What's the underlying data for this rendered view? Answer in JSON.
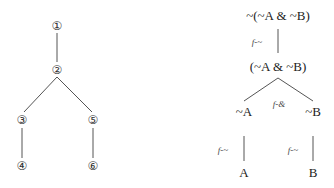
{
  "left_tree": {
    "nodes": [
      {
        "id": "n1",
        "label": "①",
        "x": 57,
        "y": 26
      },
      {
        "id": "n2",
        "label": "②",
        "x": 57,
        "y": 70
      },
      {
        "id": "n3",
        "label": "③",
        "x": 22,
        "y": 120
      },
      {
        "id": "n4",
        "label": "④",
        "x": 22,
        "y": 166
      },
      {
        "id": "n5",
        "label": "⑤",
        "x": 93,
        "y": 120
      },
      {
        "id": "n6",
        "label": "⑥",
        "x": 93,
        "y": 166
      }
    ],
    "edges": [
      [
        "n1",
        "n2"
      ],
      [
        "n2",
        "n3"
      ],
      [
        "n2",
        "n5"
      ],
      [
        "n3",
        "n4"
      ],
      [
        "n5",
        "n6"
      ]
    ]
  },
  "right_tree": {
    "nodes": [
      {
        "id": "r1",
        "label": "~(~A & ~B)",
        "x": 278,
        "y": 15
      },
      {
        "id": "r2",
        "label": "(~A & ~B)",
        "x": 278,
        "y": 66
      },
      {
        "id": "r3",
        "label": "~A",
        "x": 244,
        "y": 111
      },
      {
        "id": "r4",
        "label": "~B",
        "x": 313,
        "y": 111
      },
      {
        "id": "r5",
        "label": "A",
        "x": 244,
        "y": 172
      },
      {
        "id": "r6",
        "label": "B",
        "x": 313,
        "y": 172
      }
    ],
    "rules": [
      {
        "label": "f-~",
        "x": 257,
        "y": 42
      },
      {
        "label": "f-&",
        "x": 279,
        "y": 104
      },
      {
        "label": "f-~",
        "x": 223,
        "y": 150
      },
      {
        "label": "f-~",
        "x": 293,
        "y": 150
      }
    ]
  }
}
